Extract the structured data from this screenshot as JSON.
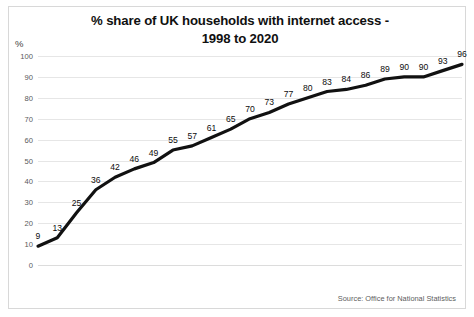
{
  "chart_data": {
    "type": "line",
    "title": "% share of UK households with internet access - 1998 to 2020",
    "title_line1": "% share of UK households with internet access -",
    "title_line2": "1998 to 2020",
    "xlabel": "",
    "ylabel": "%",
    "ylim": [
      0,
      100
    ],
    "ytick_step": 10,
    "yticks": [
      "0",
      "10",
      "20",
      "30",
      "40",
      "50",
      "60",
      "70",
      "80",
      "90",
      "100"
    ],
    "grid": true,
    "legend": "none",
    "line_color": "#111111",
    "categories": [
      "1998",
      "1999",
      "2000",
      "2001",
      "2002",
      "2003",
      "2004",
      "2005",
      "2006",
      "2007",
      "2008",
      "2009",
      "2010",
      "2011",
      "2012",
      "2013",
      "2014",
      "2015",
      "2016",
      "2017",
      "2018",
      "2019",
      "2020"
    ],
    "values": [
      9,
      13,
      25,
      36,
      42,
      46,
      49,
      55,
      57,
      61,
      65,
      70,
      73,
      77,
      80,
      83,
      84,
      86,
      89,
      90,
      90,
      93,
      96
    ],
    "data_labels": [
      "9",
      "13",
      "25",
      "36",
      "42",
      "46",
      "49",
      "55",
      "57",
      "61",
      "65",
      "70",
      "73",
      "77",
      "80",
      "83",
      "84",
      "86",
      "89",
      "90",
      "90",
      "93",
      "96"
    ],
    "annotations": [
      "Source: Office for National Statistics"
    ]
  },
  "footer": {
    "source": "Source: Office for National Statistics"
  }
}
